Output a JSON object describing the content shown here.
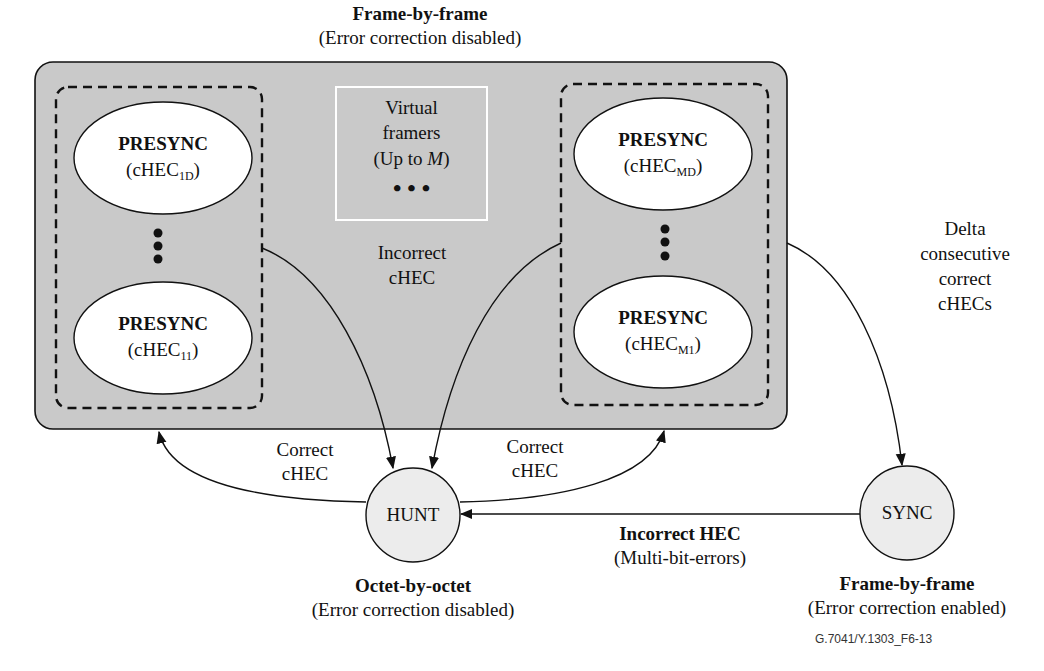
{
  "top_state": {
    "title": "Frame-by-frame",
    "subtitle": "(Error correction disabled)"
  },
  "virtual_framers": {
    "line1": "Virtual",
    "line2": "framers",
    "line3_prefix": "(Up to ",
    "line3_var": "M",
    "line3_suffix": ")",
    "dots": "• • •"
  },
  "presync_group_1": {
    "top": {
      "title": "PRESYNC",
      "label_prefix": "(cHEC",
      "label_sub": "1D",
      "label_suffix": ")"
    },
    "bottom": {
      "title": "PRESYNC",
      "label_prefix": "(cHEC",
      "label_sub": "11",
      "label_suffix": ")"
    }
  },
  "presync_group_M": {
    "top": {
      "title": "PRESYNC",
      "label_prefix": "(cHEC",
      "label_sub": "MD",
      "label_suffix": ")"
    },
    "bottom": {
      "title": "PRESYNC",
      "label_prefix": "(cHEC",
      "label_sub": "M1",
      "label_suffix": ")"
    }
  },
  "edges": {
    "incorrect_chec": {
      "line1": "Incorrect",
      "line2": "cHEC"
    },
    "correct_chec_left": {
      "line1": "Correct",
      "line2": "cHEC"
    },
    "correct_chec_right": {
      "line1": "Correct",
      "line2": "cHEC"
    },
    "delta": {
      "line1": "Delta",
      "line2": "consecutive",
      "line3": "correct",
      "line4": "cHECs"
    },
    "incorrect_hec": {
      "title": "Incorrect HEC",
      "subtitle": "(Multi-bit-errors)"
    }
  },
  "hunt": {
    "label": "HUNT",
    "title": "Octet-by-octet",
    "subtitle": "(Error correction disabled)"
  },
  "sync": {
    "label": "SYNC",
    "title": "Frame-by-frame",
    "subtitle": "(Error correction enabled)"
  },
  "figure_id": "G.7041/Y.1303_F6-13",
  "colors": {
    "presync_region": "#c9c9c9",
    "state_circle": "#ececec",
    "ellipse": "#ffffff",
    "stroke": "#111111"
  }
}
